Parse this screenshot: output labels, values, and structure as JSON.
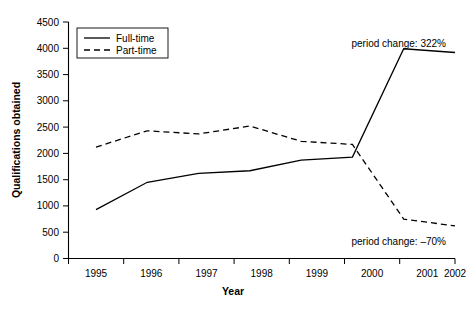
{
  "chart_data": {
    "type": "line",
    "title": "",
    "xlabel": "Year",
    "ylabel": "Qualifications obtained",
    "categories": [
      "1995",
      "1996",
      "1997",
      "1998",
      "1999",
      "2000",
      "2001",
      "2002"
    ],
    "x": [
      1995,
      1996,
      1997,
      1998,
      1999,
      2000,
      2001,
      2002
    ],
    "series": [
      {
        "name": "Full-time",
        "style": "solid",
        "values": [
          930,
          1450,
          1620,
          1670,
          1870,
          1930,
          3990,
          3920
        ]
      },
      {
        "name": "Part-time",
        "style": "dashed",
        "values": [
          2120,
          2430,
          2370,
          2520,
          2230,
          2170,
          750,
          620
        ]
      }
    ],
    "ylim": [
      0,
      4500
    ],
    "ytick_step": 500,
    "yticks": [
      "0",
      "500",
      "1000",
      "1500",
      "2000",
      "2500",
      "3000",
      "3500",
      "4000",
      "4500"
    ],
    "grid": false,
    "legend_position": "top-left",
    "legend": [
      "Full-time",
      "Part-time"
    ],
    "annotations": [
      {
        "id": "full-time-period-change",
        "text": "period change: 322%",
        "position": "top-right"
      },
      {
        "id": "part-time-period-change",
        "text": "period change: –70%",
        "position": "bottom-right"
      }
    ]
  }
}
